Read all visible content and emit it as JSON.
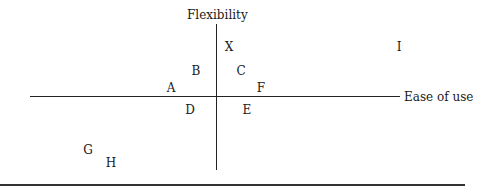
{
  "diagram": {
    "y_axis_label": "Flexibility",
    "x_axis_label": "Ease of use",
    "points": [
      {
        "label": "X",
        "x": 229,
        "y": 47
      },
      {
        "label": "I",
        "x": 399,
        "y": 47
      },
      {
        "label": "B",
        "x": 196,
        "y": 71
      },
      {
        "label": "C",
        "x": 241,
        "y": 71
      },
      {
        "label": "A",
        "x": 171,
        "y": 88
      },
      {
        "label": "F",
        "x": 261,
        "y": 88
      },
      {
        "label": "D",
        "x": 190,
        "y": 110
      },
      {
        "label": "E",
        "x": 247,
        "y": 110
      },
      {
        "label": "G",
        "x": 88,
        "y": 150
      },
      {
        "label": "H",
        "x": 111,
        "y": 163
      }
    ]
  }
}
